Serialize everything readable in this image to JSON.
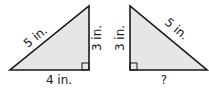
{
  "diagram": {
    "triangles": [
      {
        "id": "left",
        "hypotenuse_label": "5 in.",
        "vertical_leg_label": "3 in.",
        "horizontal_leg_label": "4 in.",
        "right_angle": "bottom-right"
      },
      {
        "id": "right",
        "hypotenuse_label": "5 in.",
        "vertical_leg_label": "3 in.",
        "horizontal_leg_label": "?",
        "right_angle": "bottom-left"
      }
    ],
    "colors": {
      "fill": "#e6e6e6",
      "stroke": "#1a1a1a"
    }
  }
}
